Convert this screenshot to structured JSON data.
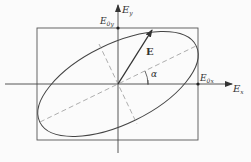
{
  "diagram": {
    "labels": {
      "x_axis": "E",
      "x_axis_sub": "x",
      "y_axis": "E",
      "y_axis_sub": "y",
      "e0x": "E",
      "e0x_sub": "0x",
      "e0y": "E",
      "e0y_sub": "0y",
      "vector": "E",
      "angle": "α"
    },
    "colors": {
      "line": "#444444",
      "dashed": "#9a9a9a",
      "background": "#fbfbfb"
    }
  }
}
